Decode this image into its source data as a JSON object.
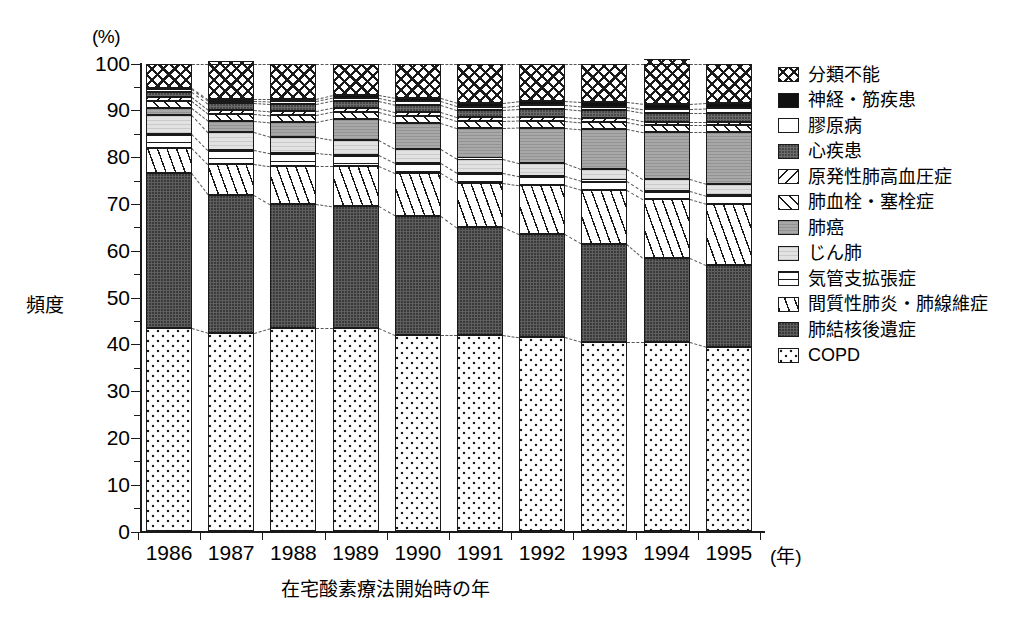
{
  "axes": {
    "y_unit": "(%)",
    "y_title": "頻度",
    "y_ticks": [
      "0",
      "10",
      "20",
      "30",
      "40",
      "50",
      "60",
      "70",
      "80",
      "90",
      "100"
    ],
    "x_title": "在宅酸素療法開始時の年",
    "x_unit": "(年)",
    "x_ticks": [
      "1986",
      "1987",
      "1988",
      "1989",
      "1990",
      "1991",
      "1992",
      "1993",
      "1994",
      "1995"
    ]
  },
  "legend": {
    "items": [
      {
        "label": "分類不能",
        "key": "unclassified",
        "pattern": "p-unclass",
        "color": "#ffffff"
      },
      {
        "label": "神経・筋疾患",
        "key": "neuromuscular",
        "pattern": "p-neuro",
        "color": "#111111"
      },
      {
        "label": "膠原病",
        "key": "collagen",
        "pattern": "p-collagen",
        "color": "#ffffff"
      },
      {
        "label": "心疾患",
        "key": "heart",
        "pattern": "p-heart",
        "color": "#6b6b6b"
      },
      {
        "label": "原発性肺高血圧症",
        "key": "pph",
        "pattern": "p-pph",
        "color": "#ffffff"
      },
      {
        "label": "肺血栓・塞栓症",
        "key": "embolism",
        "pattern": "p-embol",
        "color": "#ffffff"
      },
      {
        "label": "肺癌",
        "key": "lung_cancer",
        "pattern": "p-cancer",
        "color": "#a8a8a8"
      },
      {
        "label": "じん肺",
        "key": "pneumoconiosis",
        "pattern": "p-pneumo",
        "color": "#e2e2e2"
      },
      {
        "label": "気管支拡張症",
        "key": "bronchiectasis",
        "pattern": "p-bronch",
        "color": "#ffffff"
      },
      {
        "label": "間質性肺炎・肺線維症",
        "key": "ipf",
        "pattern": "p-ipf",
        "color": "#ffffff"
      },
      {
        "label": "肺結核後遺症",
        "key": "tb_sequelae",
        "pattern": "p-tb",
        "color": "#5e5e5e"
      },
      {
        "label": "COPD",
        "key": "copd",
        "pattern": "p-copd",
        "color": "#fdfdfd"
      }
    ]
  },
  "chart_data": {
    "type": "bar",
    "stacked": true,
    "title": "",
    "xlabel": "在宅酸素療法開始時の年",
    "ylabel": "頻度",
    "yunit": "(%)",
    "ylim": [
      0,
      100
    ],
    "grid": false,
    "legend_position": "right",
    "categories": [
      "1986",
      "1987",
      "1988",
      "1989",
      "1990",
      "1991",
      "1992",
      "1993",
      "1994",
      "1995"
    ],
    "series": [
      {
        "name": "COPD",
        "values": [
          43.5,
          42.5,
          43.5,
          43.5,
          42.0,
          42.0,
          41.5,
          40.5,
          40.5,
          39.5
        ]
      },
      {
        "name": "肺結核後遺症",
        "values": [
          33.0,
          29.5,
          26.5,
          26.0,
          25.5,
          23.0,
          22.0,
          21.0,
          18.0,
          17.5
        ]
      },
      {
        "name": "間質性肺炎・肺線維症",
        "values": [
          5.5,
          6.5,
          8.0,
          8.5,
          9.0,
          9.5,
          10.5,
          11.5,
          12.5,
          13.0
        ]
      },
      {
        "name": "気管支拡張症",
        "values": [
          3.0,
          3.0,
          2.8,
          2.5,
          2.3,
          2.2,
          2.0,
          2.0,
          1.8,
          1.8
        ]
      },
      {
        "name": "じん肺",
        "values": [
          4.0,
          3.8,
          3.5,
          3.2,
          3.0,
          3.0,
          2.8,
          2.5,
          2.5,
          2.5
        ]
      },
      {
        "name": "肺癌",
        "values": [
          1.5,
          2.5,
          3.2,
          4.5,
          5.5,
          6.5,
          7.5,
          8.5,
          10.0,
          11.0
        ]
      },
      {
        "name": "肺血栓・塞栓症",
        "values": [
          1.5,
          1.5,
          1.5,
          1.5,
          1.5,
          1.5,
          1.5,
          1.5,
          1.5,
          1.5
        ]
      },
      {
        "name": "原発性肺高血圧症",
        "values": [
          0.8,
          0.8,
          0.8,
          0.8,
          0.8,
          0.8,
          0.8,
          0.8,
          0.8,
          0.8
        ]
      },
      {
        "name": "心疾患",
        "values": [
          1.2,
          1.4,
          1.5,
          1.5,
          1.6,
          1.6,
          1.7,
          1.7,
          1.8,
          1.8
        ]
      },
      {
        "name": "膠原病",
        "values": [
          0.5,
          0.5,
          0.6,
          0.6,
          0.7,
          0.7,
          0.8,
          0.8,
          0.9,
          1.0
        ]
      },
      {
        "name": "神経・筋疾患",
        "values": [
          0.3,
          0.4,
          0.5,
          0.6,
          0.7,
          0.8,
          0.9,
          1.0,
          1.1,
          1.2
        ]
      },
      {
        "name": "分類不能",
        "values": [
          5.2,
          8.1,
          7.6,
          6.8,
          7.4,
          8.4,
          8.0,
          8.2,
          9.6,
          8.4
        ]
      }
    ]
  }
}
